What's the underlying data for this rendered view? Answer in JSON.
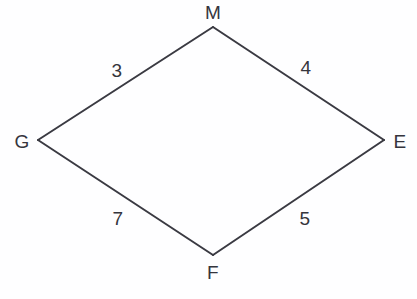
{
  "figure": {
    "kind": "quadrilateral",
    "name": "GMEF",
    "background_color": "#fefeff",
    "stroke_color": "#3a3a42",
    "text_color": "#35353d",
    "stroke_width": 2,
    "width": 417,
    "height": 299
  },
  "chart_data": {
    "type": "diagram",
    "title": "",
    "shape": "quadrilateral",
    "vertices": [
      {
        "label": "M",
        "x": 213,
        "y": 27,
        "label_x": 213,
        "label_y": 12,
        "position": "top"
      },
      {
        "label": "E",
        "x": 384,
        "y": 140,
        "label_x": 400,
        "label_y": 141,
        "position": "right"
      },
      {
        "label": "F",
        "x": 213,
        "y": 255,
        "label_x": 213,
        "label_y": 272,
        "position": "bottom"
      },
      {
        "label": "G",
        "x": 38,
        "y": 140,
        "label_x": 22,
        "label_y": 141,
        "position": "left"
      }
    ],
    "edges": [
      {
        "from": "G",
        "to": "M",
        "label": "3",
        "label_x": 117,
        "label_y": 70
      },
      {
        "from": "M",
        "to": "E",
        "label": "4",
        "label_x": 306,
        "label_y": 67
      },
      {
        "from": "G",
        "to": "F",
        "label": "7",
        "label_x": 118,
        "label_y": 218
      },
      {
        "from": "F",
        "to": "E",
        "label": "5",
        "label_x": 305,
        "label_y": 218
      }
    ],
    "side_lengths": {
      "GM": "3",
      "ME": "4",
      "GF": "7",
      "FE": "5"
    }
  },
  "vertices": {
    "top": {
      "label": "M"
    },
    "right": {
      "label": "E"
    },
    "bottom": {
      "label": "F"
    },
    "left": {
      "label": "G"
    }
  },
  "sides": {
    "upper_left": {
      "label": "3"
    },
    "upper_right": {
      "label": "4"
    },
    "lower_left": {
      "label": "7"
    },
    "lower_right": {
      "label": "5"
    }
  }
}
